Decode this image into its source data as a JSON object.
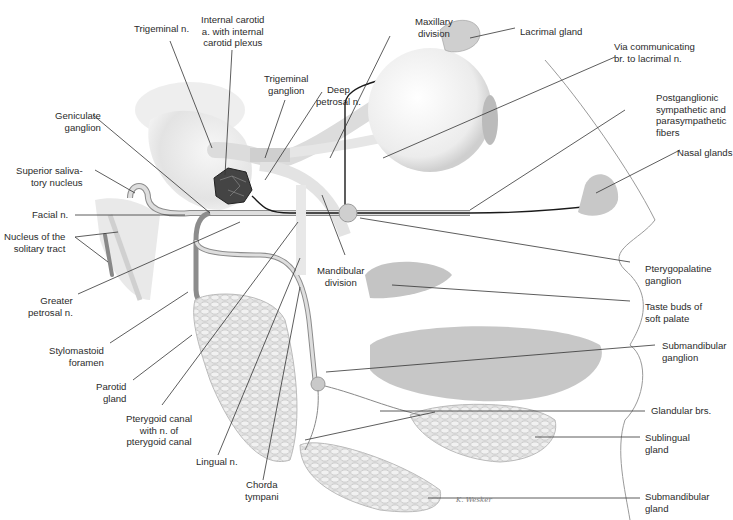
{
  "figure": {
    "signature": "K. Wesker",
    "colors": {
      "background": "#ffffff",
      "leader_line": "#333333",
      "nerve_fill": "#d9d9d9",
      "nerve_outline": "#8c8c8c",
      "preganglionic_fiber": "#1a1a1a",
      "carotid_plexus": "#3c3c3c",
      "gland_gray": "#bdbdbd",
      "tongue_gray": "#a8a8a8",
      "face_outline": "#9a9a9a"
    }
  },
  "labels": {
    "trigeminal_n": "Trigeminal n.",
    "internal_carotid": "Internal carotid\na. with internal\ncarotid plexus",
    "trigeminal_ganglion": "Trigeminal\nganglion",
    "deep_petrosal": "Deep\npetrosal n.",
    "maxillary_division": "Maxillary\ndivision",
    "lacrimal_gland": "Lacrimal gland",
    "communicating_br": "Via communicating\nbr. to lacrimal n.",
    "postganglionic": "Postganglionic\nsympathetic and\nparasympathetic\nfibers",
    "nasal_glands": "Nasal glands",
    "geniculate_ganglion": "Geniculate\nganglion",
    "superior_salivatory": "Superior saliva-\ntory nucleus",
    "facial_n": "Facial n.",
    "solitary_tract": "Nucleus of the\nsolitary tract",
    "greater_petrosal": "Greater\npetrosal n.",
    "stylomastoid": "Stylomastoid\nforamen",
    "parotid_gland": "Parotid\ngland",
    "pterygoid_canal": "Pterygoid canal\nwith n. of\npterygoid canal",
    "lingual_n": "Lingual n.",
    "chorda_tympani": "Chorda\ntympani",
    "mandibular_division": "Mandibular\ndivision",
    "pterygopalatine_ganglion": "Pterygopalatine\nganglion",
    "taste_buds": "Taste buds of\nsoft palate",
    "submandibular_ganglion": "Submandibular\nganglion",
    "glandular_brs": "Glandular brs.",
    "sublingual_gland": "Sublingual\ngland",
    "submandibular_gland": "Submandibular\ngland"
  }
}
